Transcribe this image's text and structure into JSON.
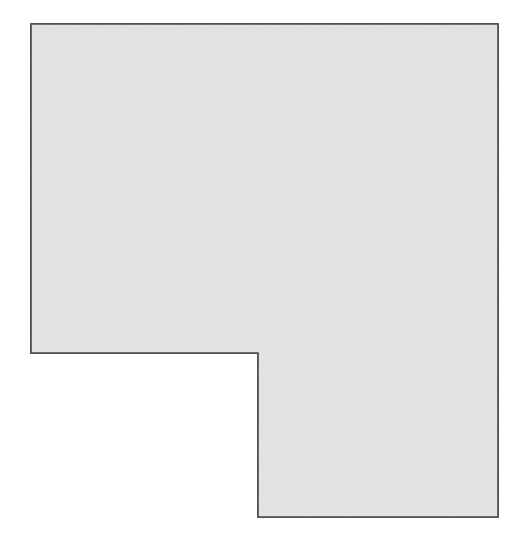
{
  "canvas": {
    "width": 523,
    "height": 550,
    "background_color": "#ffffff",
    "name": "shape-canvas"
  },
  "shape": {
    "label": "L-shaped polygon",
    "kind": "polygon",
    "fill_color": "#e4e4e4",
    "stroke_color": "#4a4a4a",
    "stroke_width": 1.6,
    "texture": "subtle-paper-noise",
    "points": [
      {
        "x": 31,
        "y": 24
      },
      {
        "x": 498,
        "y": 24
      },
      {
        "x": 498,
        "y": 517
      },
      {
        "x": 258,
        "y": 517
      },
      {
        "x": 258,
        "y": 353
      },
      {
        "x": 31,
        "y": 353
      }
    ],
    "path_d": "M 31 24 L 498 24 L 498 517 L 258 517 L 258 353 L 31 353 Z",
    "bounding_box": {
      "x": 31,
      "y": 24,
      "width": 467,
      "height": 493
    },
    "notch": {
      "label": "bottom-left cutout",
      "x": 31,
      "y": 353,
      "width": 227,
      "height": 164
    }
  },
  "annotations": {
    "title": "",
    "subtitle": "",
    "items": []
  }
}
